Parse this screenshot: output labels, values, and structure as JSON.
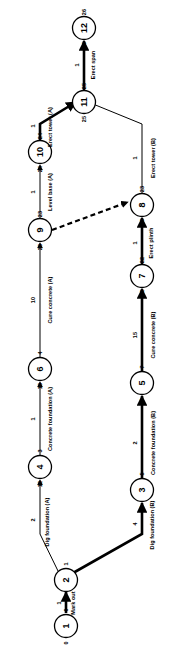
{
  "diagram": {
    "type": "activity-on-arrow-network",
    "orientation": "rotated-90-ccw",
    "nodes": [
      {
        "id": "1",
        "label": "1",
        "early": "0",
        "late": "0"
      },
      {
        "id": "2",
        "label": "2",
        "early": "1",
        "late": "1"
      },
      {
        "id": "3",
        "label": "3",
        "early": "5",
        "late": "5"
      },
      {
        "id": "4",
        "label": "4",
        "early": "3",
        "late": "12"
      },
      {
        "id": "5",
        "label": "5",
        "early": "7",
        "late": "7"
      },
      {
        "id": "6",
        "label": "6",
        "early": "4",
        "late": "13"
      },
      {
        "id": "7",
        "label": "7",
        "early": "22",
        "late": "22"
      },
      {
        "id": "8",
        "label": "8",
        "early": "23",
        "late": "23"
      },
      {
        "id": "9",
        "label": "9",
        "early": "23",
        "late": "23"
      },
      {
        "id": "10",
        "label": "10",
        "early": "24",
        "late": "24"
      },
      {
        "id": "11",
        "label": "11",
        "early": "25",
        "late": "25"
      },
      {
        "id": "12",
        "label": "12",
        "early": "26",
        "late": "26"
      }
    ],
    "activities": [
      {
        "from": "1",
        "to": "2",
        "name": "Mark out",
        "duration": "1",
        "critical": true
      },
      {
        "from": "2",
        "to": "4",
        "name": "Dig foundation (A)",
        "duration": "2",
        "critical": false
      },
      {
        "from": "4",
        "to": "6",
        "name": "Concrete foundation (A)",
        "duration": "1",
        "critical": false
      },
      {
        "from": "6",
        "to": "9",
        "name": "Cure concrete (A)",
        "duration": "10",
        "critical": false
      },
      {
        "from": "9",
        "to": "10",
        "name": "Level base (A)",
        "duration": "1",
        "critical": false
      },
      {
        "from": "10",
        "to": "11",
        "name": "Erect tower (A)",
        "duration": "1",
        "critical": true
      },
      {
        "from": "2",
        "to": "3",
        "name": "Dig foundation (B)",
        "duration": "4",
        "critical": true
      },
      {
        "from": "3",
        "to": "5",
        "name": "Concrete foundation (B)",
        "duration": "2",
        "critical": true
      },
      {
        "from": "5",
        "to": "7",
        "name": "Cure concrete (B)",
        "duration": "15",
        "critical": true
      },
      {
        "from": "7",
        "to": "8",
        "name": "Erect plinth",
        "duration": "1",
        "critical": true
      },
      {
        "from": "8",
        "to": "11",
        "name": "Erect tower (B)",
        "duration": "1",
        "critical": false
      },
      {
        "from": "11",
        "to": "12",
        "name": "Erect span",
        "duration": "1",
        "critical": true
      },
      {
        "from": "9",
        "to": "8",
        "name": "",
        "duration": "",
        "critical": false,
        "dummy": true
      }
    ],
    "colors": {
      "line": "#000000",
      "node_fill": "#ffffff",
      "background": "#ffffff"
    }
  }
}
